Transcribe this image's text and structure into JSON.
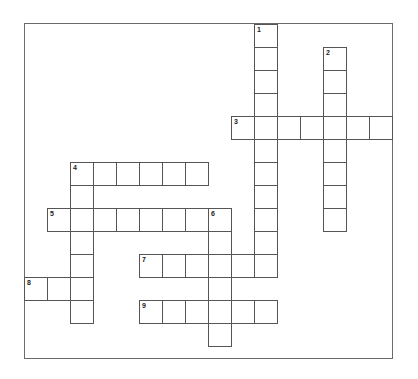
{
  "puzzle": {
    "cell_size": 23,
    "origin": {
      "x": 24,
      "y": 24
    },
    "entries": [
      {
        "number": "1",
        "direction": "down",
        "col": 10,
        "row": 0,
        "length": 11
      },
      {
        "number": "2",
        "direction": "down",
        "col": 13,
        "row": 1,
        "length": 8
      },
      {
        "number": "3",
        "direction": "across",
        "col": 9,
        "row": 4,
        "length": 7
      },
      {
        "number": "4",
        "direction": "across",
        "col": 2,
        "row": 6,
        "length": 6
      },
      {
        "number": "4",
        "direction": "down",
        "col": 2,
        "row": 6,
        "length": 7
      },
      {
        "number": "5",
        "direction": "across",
        "col": 1,
        "row": 8,
        "length": 8
      },
      {
        "number": "6",
        "direction": "down",
        "col": 8,
        "row": 8,
        "length": 6
      },
      {
        "number": "7",
        "direction": "across",
        "col": 5,
        "row": 10,
        "length": 6
      },
      {
        "number": "8",
        "direction": "across",
        "col": 0,
        "row": 11,
        "length": 3
      },
      {
        "number": "9",
        "direction": "across",
        "col": 5,
        "row": 12,
        "length": 6
      }
    ]
  }
}
